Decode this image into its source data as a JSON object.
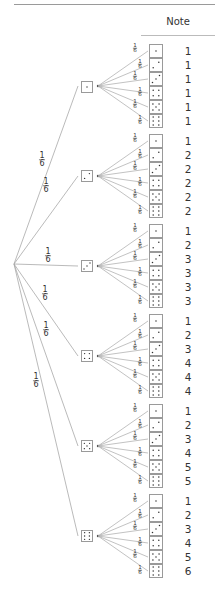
{
  "header": {
    "column_title": "Note"
  },
  "tree": {
    "branch_probability": "1/6",
    "branch_numerator": "1",
    "branch_denominator": "6",
    "first_die_faces": [
      1,
      2,
      3,
      4,
      5,
      6
    ],
    "second_die_faces": [
      1,
      2,
      3,
      4,
      5,
      6
    ],
    "notes": [
      [
        "1",
        "1",
        "1",
        "1",
        "1",
        "1"
      ],
      [
        "1",
        "2",
        "2",
        "2",
        "2",
        "2"
      ],
      [
        "1",
        "2",
        "3",
        "3",
        "3",
        "3"
      ],
      [
        "1",
        "2",
        "3",
        "4",
        "4",
        "4"
      ],
      [
        "1",
        "2",
        "3",
        "4",
        "5",
        "5"
      ],
      [
        "1",
        "2",
        "3",
        "4",
        "5",
        "6"
      ]
    ]
  },
  "colors": {
    "line": "#a8a8a8",
    "box_border": "#9a9a9a",
    "pip": "#333333",
    "text": "#333333"
  }
}
